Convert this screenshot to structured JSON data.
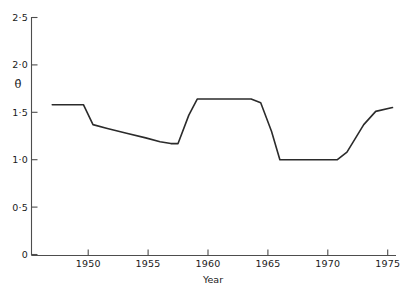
{
  "chart_data": {
    "type": "line",
    "title": "",
    "subtitle": "",
    "xlabel": "Year",
    "ylabel": "θ̂",
    "xlim": [
      1947,
      1975.6
    ],
    "ylim": [
      0,
      2.5
    ],
    "grid": false,
    "legend": null,
    "legend_position": "none",
    "x_tick_labels": [
      "1950",
      "1955",
      "1960",
      "1965",
      "1970",
      "1975"
    ],
    "x_ticks": [
      1950,
      1955,
      1960,
      1965,
      1970,
      1975
    ],
    "y_tick_labels": [
      "0",
      "0·5",
      "1·0",
      "1·5",
      "2·0",
      "2·5"
    ],
    "y_ticks": [
      0,
      0.5,
      1.0,
      1.5,
      2.0,
      2.5
    ],
    "series": [
      {
        "name": "theta-hat",
        "color": "#2b2b2b",
        "x": [
          1947.0,
          1949.6,
          1950.4,
          1951.6,
          1953.2,
          1954.8,
          1956.0,
          1956.9,
          1957.5,
          1958.4,
          1959.1,
          1963.6,
          1964.4,
          1965.3,
          1966.0,
          1970.8,
          1971.6,
          1973.0,
          1974.0,
          1975.4
        ],
        "values": [
          1.58,
          1.58,
          1.37,
          1.33,
          1.28,
          1.23,
          1.19,
          1.17,
          1.17,
          1.47,
          1.64,
          1.64,
          1.6,
          1.3,
          1.0,
          1.0,
          1.08,
          1.37,
          1.51,
          1.55
        ]
      }
    ],
    "annotations": []
  },
  "axis": {
    "y_symbol": "θ̂",
    "x_title": "Year"
  }
}
